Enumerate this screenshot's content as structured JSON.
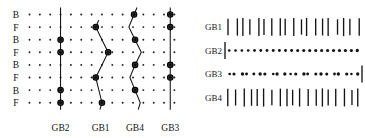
{
  "figure": {
    "title": "",
    "panels": [
      "left-grain-boundary-map",
      "right-trace-strip"
    ]
  },
  "left_panel": {
    "name": "grain-boundary-trace-plot",
    "row_labels": [
      "B",
      "F",
      "B",
      "F",
      "B",
      "F",
      "B",
      "F"
    ],
    "column_labels": [
      "GB2",
      "GB1",
      "GB4",
      "GB3"
    ],
    "grid": {
      "rows": 8,
      "cols": 15,
      "dot_color": "#1b1b1b"
    },
    "traces": [
      {
        "label": "GB2",
        "kind": "straight-vertical",
        "x": [
          4.0,
          4.0,
          4.0,
          4.0,
          4.0,
          4.0,
          4.0,
          4.0
        ],
        "nodes": [
          3,
          4,
          7,
          8
        ]
      },
      {
        "label": "GB1",
        "kind": "zigzag",
        "x": [
          null,
          7.4,
          8.0,
          8.6,
          8.0,
          7.4,
          7.7,
          8.0
        ],
        "nodes": [
          2,
          4,
          6,
          8
        ]
      },
      {
        "label": "GB4",
        "kind": "zigzag",
        "x": [
          11.1,
          10.6,
          11.2,
          11.8,
          11.2,
          10.7,
          11.2,
          11.7
        ],
        "nodes": [
          1,
          3,
          5,
          7
        ]
      },
      {
        "label": "GB3",
        "kind": "straight-vertical",
        "x": [
          14.6,
          14.6,
          14.6,
          14.6,
          14.6,
          14.6,
          14.6,
          14.6
        ],
        "nodes": [
          1,
          2,
          5,
          6
        ]
      }
    ]
  },
  "right_panel": {
    "name": "trace-strip-panel",
    "rows": [
      {
        "label": "GB1",
        "pattern": "bars",
        "count": 19,
        "lead": "none",
        "trail": "none"
      },
      {
        "label": "GB2",
        "pattern": "dots",
        "count": 22,
        "lead": "bar",
        "trail": "none"
      },
      {
        "label": "GB3",
        "pattern": "dots",
        "count": 22,
        "lead": "none",
        "trail": "bar"
      },
      {
        "label": "GB4",
        "pattern": "bars",
        "count": 19,
        "lead": "none",
        "trail": "none"
      }
    ]
  },
  "colors": {
    "ink": "#141414",
    "background": "#ffffff"
  }
}
